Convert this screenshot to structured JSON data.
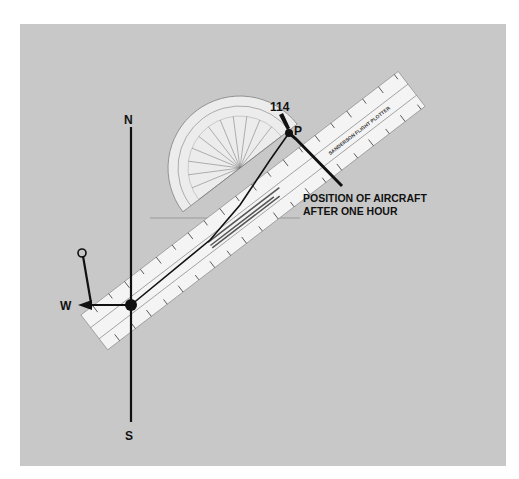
{
  "figure": {
    "background_color": "#c8c8c8",
    "compass": {
      "north_label": "N",
      "south_label": "S",
      "west_label": "W",
      "origin_label": "O"
    },
    "plotter": {
      "name": "SANDERSON FLIGHT PLOTTER",
      "heading_value": "114"
    },
    "position": {
      "point_label": "P",
      "annotation_line1": "POSITION OF AIRCRAFT",
      "annotation_line2": "AFTER ONE HOUR"
    }
  }
}
